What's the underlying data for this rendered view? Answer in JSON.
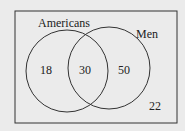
{
  "diagram": {
    "type": "venn",
    "sets": [
      {
        "name": "Americans",
        "only_value": "18"
      },
      {
        "name": "Men",
        "only_value": "50"
      }
    ],
    "intersection_value": "30",
    "outside_value": "22",
    "colors": {
      "stroke": "#333333",
      "background": "#ebebeb"
    }
  }
}
